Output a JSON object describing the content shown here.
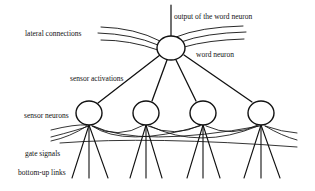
{
  "diagram": {
    "type": "neural-network-schematic",
    "labels": {
      "output": "output of the word neuron",
      "lateral": "lateral connections",
      "word_neuron": "word neuron",
      "sensor_activations": "sensor activations",
      "sensor_neurons": "sensor neurons",
      "gate_signals": "gate signals",
      "bottom_up": "bottom-up links"
    },
    "nodes": [
      {
        "id": "word",
        "label": "word neuron",
        "layer": "top"
      },
      {
        "id": "s1",
        "label": "sensor neuron 1",
        "layer": "sensor"
      },
      {
        "id": "s2",
        "label": "sensor neuron 2",
        "layer": "sensor"
      },
      {
        "id": "s3",
        "label": "sensor neuron 3",
        "layer": "sensor"
      },
      {
        "id": "s4",
        "label": "sensor neuron 4",
        "layer": "sensor"
      }
    ],
    "edges": [
      {
        "from": "s1",
        "to": "word",
        "label": "sensor activations"
      },
      {
        "from": "s2",
        "to": "word"
      },
      {
        "from": "s3",
        "to": "word"
      },
      {
        "from": "s4",
        "to": "word"
      }
    ],
    "colors": {
      "stroke": "#111111",
      "background": "#ffffff"
    }
  }
}
